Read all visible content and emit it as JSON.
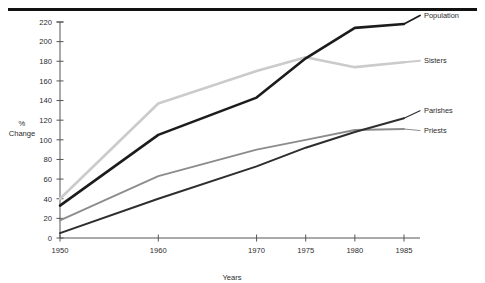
{
  "chart_data": {
    "type": "line",
    "title": "",
    "xlabel": "Years",
    "ylabel": "% Change",
    "ylabel_lines": [
      "%",
      "Change"
    ],
    "x": [
      1950,
      1960,
      1970,
      1975,
      1980,
      1985
    ],
    "categories": [
      "1950",
      "1960",
      "1970",
      "1975",
      "1980",
      "1985"
    ],
    "xlim": [
      1950,
      1985
    ],
    "ylim": [
      0,
      220
    ],
    "ytick_values": [
      0,
      20,
      40,
      60,
      80,
      100,
      120,
      140,
      160,
      180,
      200,
      220
    ],
    "ytick_labels": [
      "0",
      "20",
      "40",
      "60",
      "80",
      "100",
      "120",
      "140",
      "160",
      "180",
      "200",
      "220"
    ],
    "xtick_values": [
      1950,
      1960,
      1970,
      1975,
      1980,
      1985
    ],
    "xtick_labels": [
      "1950",
      "1960",
      "1970",
      "1975",
      "1980",
      "1985"
    ],
    "grid": false,
    "legend_position": "right-inline-labels",
    "series": [
      {
        "name": "Population",
        "color": "#1c1c1c",
        "width": 2.6,
        "values": [
          33,
          105,
          143,
          183,
          214,
          218
        ]
      },
      {
        "name": "Sisters",
        "color": "#cbcbcb",
        "width": 2.6,
        "values": [
          40,
          137,
          170,
          184,
          174,
          179
        ]
      },
      {
        "name": "Parishes",
        "color": "#2e2e2e",
        "width": 2.0,
        "values": [
          5,
          40,
          73,
          92,
          108,
          122
        ]
      },
      {
        "name": "Priests",
        "color": "#8c8c8c",
        "width": 1.8,
        "values": [
          18,
          63,
          90,
          100,
          110,
          111
        ]
      }
    ]
  },
  "figure": {
    "top_rule": "horizontal-rule",
    "background_color": "#ffffff"
  }
}
